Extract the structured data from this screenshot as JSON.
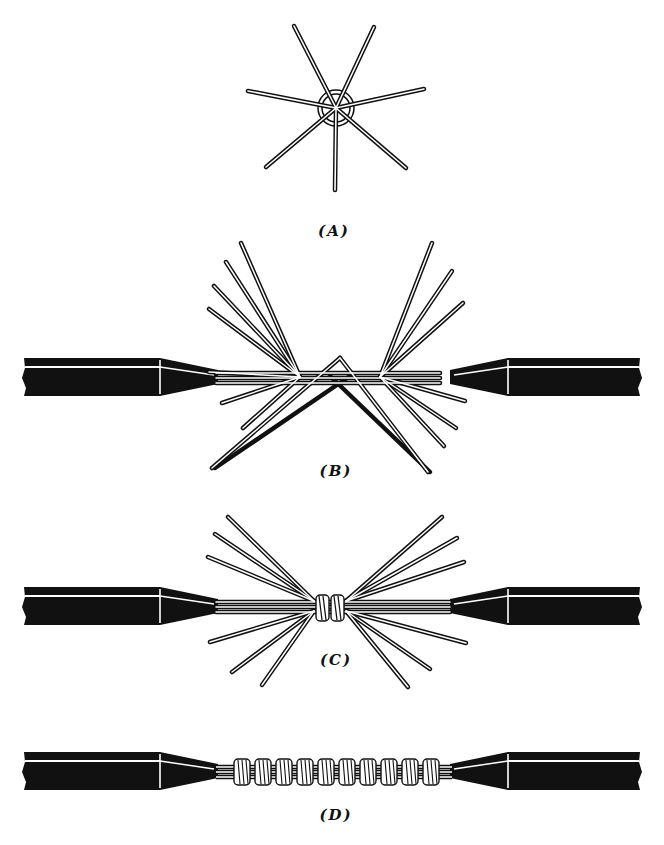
{
  "diagram": {
    "colors": {
      "ink": "#111111",
      "paper": "#ffffff",
      "strand_fill": "#ffffff"
    },
    "panels": [
      {
        "id": "A",
        "label": "(A)",
        "description": "End view of strands fanned out radially around cable core",
        "strand_count": 8
      },
      {
        "id": "B",
        "label": "(B)",
        "description": "Two insulated cable ends with strands fanned and interlaced",
        "strands_per_side": 7
      },
      {
        "id": "C",
        "label": "(C)",
        "description": "Strands interlaced with first wraps in center",
        "strands_per_side": 7
      },
      {
        "id": "D",
        "label": "(D)",
        "description": "Completed splice with strands wrapped tightly",
        "wrap_count": 10
      }
    ]
  }
}
